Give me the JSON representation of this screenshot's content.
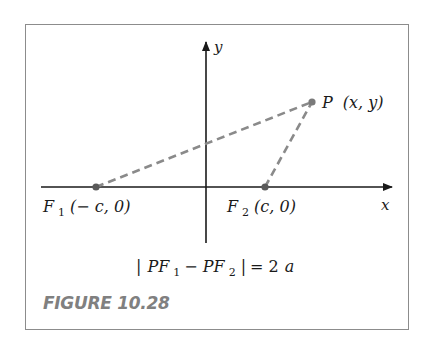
{
  "figure": {
    "caption": "FIGURE 10.28",
    "colors": {
      "frame": "#8c8c8c",
      "axes": "#1a1a1a",
      "dashed_lines": "#8a8a8a",
      "points": "#7a7a7a",
      "caption": "#808080"
    }
  },
  "axes": {
    "x_label": "x",
    "y_label": "y"
  },
  "points": {
    "P": {
      "name": "P",
      "coords": "(x, y)"
    },
    "F1": {
      "name": "F",
      "sub": "1",
      "coords": "(− c, 0)"
    },
    "F2": {
      "name": "F",
      "sub": "2",
      "coords": "(c, 0)"
    }
  },
  "equation": {
    "bar_open": "|",
    "pf1": "PF",
    "pf1_sub": "1",
    "minus": " − ",
    "pf2": "PF",
    "pf2_sub": "2",
    "bar_close": "|",
    "equals": " = 2",
    "a": "a"
  }
}
